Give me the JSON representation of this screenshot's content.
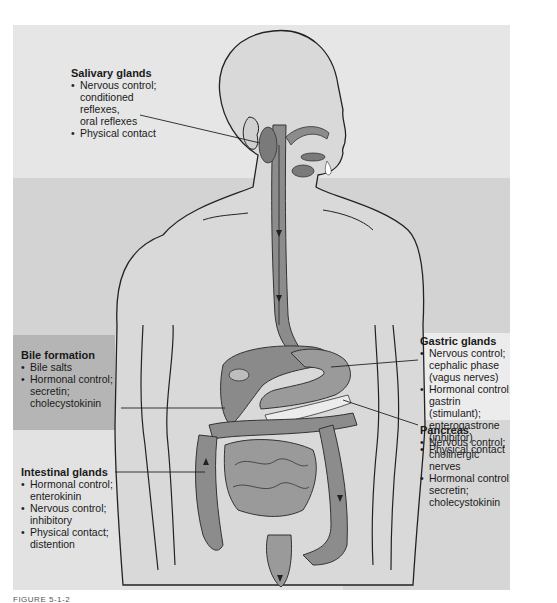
{
  "figure": {
    "caption_fragment": "FIGURE 5-1-2"
  },
  "labels": {
    "salivary": {
      "title": "Salivary glands",
      "items": [
        "Nervous control; conditioned reflexes, oral reflexes",
        "Physical contact"
      ],
      "lines": [
        "Nervous control;",
        "conditioned",
        "reflexes,",
        "oral reflexes"
      ]
    },
    "bile": {
      "title": "Bile formation",
      "items": [
        "Bile salts",
        "Hormonal control; secretin; cholecystokinin"
      ]
    },
    "intestinal": {
      "title": "Intestinal glands",
      "items": [
        "Hormonal control; enterokinin",
        "Nervous control; inhibitory",
        "Physical contact; distention"
      ]
    },
    "gastric": {
      "title": "Gastric glands",
      "items": [
        "Nervous control; cephalic phase (vagus nerves)",
        "Hormonal control; gastrin (stimulant); enterogastrone (inhibitor)",
        "Physical contact"
      ]
    },
    "pancreas": {
      "title": "Pancreas",
      "items": [
        "Nervous control; cholinergic nerves",
        "Hormonal control; secretin; cholecystokinin"
      ]
    }
  },
  "colors": {
    "background_top": "#e6e6e6",
    "background_mid": "#d3d3d3",
    "bile_box": "#b5b5b5",
    "gastric_box": "#ececec",
    "pancreas_box": "#d6d6d6",
    "body_fill": "#d9d9d9",
    "organ_fill": "#8c8c8c",
    "organ_dark": "#6e6e6e",
    "outline": "#222222"
  }
}
